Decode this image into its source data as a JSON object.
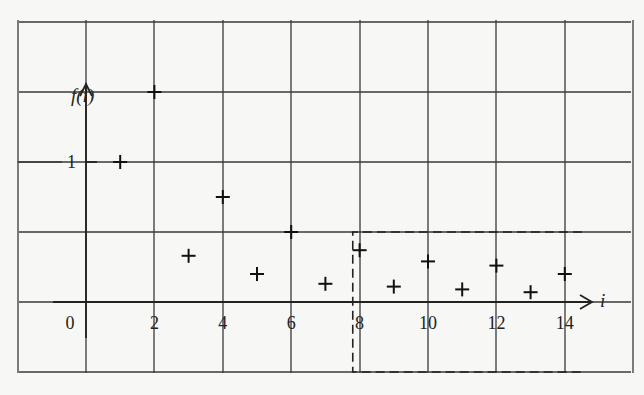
{
  "chart_data": {
    "type": "scatter",
    "title": "",
    "xlabel": "i",
    "ylabel": "f(i)",
    "marker": "+",
    "x": [
      1,
      2,
      3,
      4,
      5,
      6,
      7,
      8,
      9,
      10,
      11,
      12,
      13,
      14
    ],
    "y": [
      1.0,
      1.5,
      0.33,
      0.75,
      0.2,
      0.5,
      0.13,
      0.37,
      0.11,
      0.29,
      0.09,
      0.26,
      0.07,
      0.2
    ],
    "x_tick_labels": [
      "0",
      "2",
      "4",
      "6",
      "8",
      "10",
      "12",
      "14"
    ],
    "x_ticks": [
      0,
      2,
      4,
      6,
      8,
      10,
      12,
      14
    ],
    "y_tick_labels": [
      "1"
    ],
    "y_ticks": [
      1
    ],
    "xlim": [
      -2,
      16
    ],
    "ylim": [
      -0.5,
      2.0
    ],
    "grid": true,
    "grid_x_spacing": 2,
    "grid_y_spacing": 0.5,
    "annotations": [
      {
        "type": "dashed-rectangle",
        "x_range": [
          7.8,
          14.5
        ],
        "y_range": [
          -0.5,
          0.5
        ],
        "note": "highlights region i >= 8"
      }
    ],
    "legend": null
  },
  "labels": {
    "y_axis": "f(i)",
    "x_axis": "i",
    "y_one": "1"
  }
}
